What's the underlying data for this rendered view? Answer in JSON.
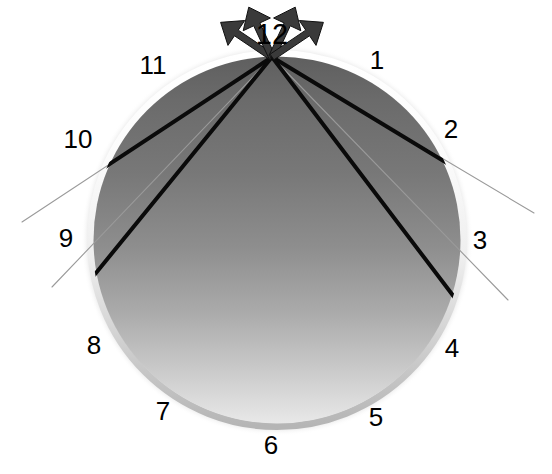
{
  "figure": {
    "type": "diagram",
    "background_color": "#ffffff",
    "width": 552,
    "height": 474
  },
  "sphere": {
    "name": "shaded-sphere",
    "center_x": 277,
    "center_y": 240,
    "radius": 187,
    "gradient_top_color": "#6e6e6e",
    "gradient_bottom_color": "#e2e2e2",
    "rim_highlight_color": "#fdfdfd",
    "rim_shadow_color": "#b8b8b8",
    "halo_color": "#f2f2f2"
  },
  "apex": {
    "name": "apex-point",
    "x": 272,
    "y": 57,
    "label": "12"
  },
  "rays": [
    {
      "id": "ray-to-10",
      "name": "thick-ray-upper-left",
      "end_x": 96,
      "end_y": 173,
      "color": "#0a0a0a",
      "width": 4.0
    },
    {
      "id": "ray-to-9",
      "name": "thick-ray-lower-left",
      "end_x": 100,
      "end_y": 268,
      "color": "#0a0a0a",
      "width": 4.0
    },
    {
      "id": "ray-to-2",
      "name": "thick-ray-upper-right",
      "end_x": 447,
      "end_y": 163,
      "color": "#0a0a0a",
      "width": 4.0
    },
    {
      "id": "ray-to-3",
      "name": "thick-ray-lower-right",
      "end_x": 442,
      "end_y": 281,
      "color": "#0a0a0a",
      "width": 4.0
    }
  ],
  "ray_extensions": [
    {
      "id": "ext-to-10",
      "name": "thin-ray-extension-upper-left",
      "end_x": 22,
      "end_y": 222,
      "color": "#9a9a9a",
      "width": 1.1
    },
    {
      "id": "ext-to-9",
      "name": "thin-ray-extension-lower-left",
      "end_x": 52,
      "end_y": 287,
      "color": "#9a9a9a",
      "width": 1.1
    },
    {
      "id": "ext-to-2",
      "name": "thin-ray-extension-upper-right",
      "end_x": 534,
      "end_y": 213,
      "color": "#9a9a9a",
      "width": 1.1
    },
    {
      "id": "ext-to-3",
      "name": "thin-ray-extension-lower-right",
      "end_x": 508,
      "end_y": 300,
      "color": "#9a9a9a",
      "width": 1.1
    }
  ],
  "arrows": [
    {
      "id": "arrow-far-left",
      "name": "arrow-outward-far-left",
      "angle_deg": 146,
      "length": 62,
      "color": "#3a3a3a"
    },
    {
      "id": "arrow-near-left",
      "name": "arrow-outward-near-left",
      "angle_deg": 115,
      "length": 55,
      "color": "#3a3a3a"
    },
    {
      "id": "arrow-near-right",
      "name": "arrow-outward-near-right",
      "angle_deg": 65,
      "length": 55,
      "color": "#3a3a3a"
    },
    {
      "id": "arrow-far-right",
      "name": "arrow-outward-far-right",
      "angle_deg": 34,
      "length": 62,
      "color": "#3a3a3a"
    }
  ],
  "hour_labels": [
    {
      "hour": "12",
      "x": 272,
      "y": 34,
      "size": "big"
    },
    {
      "hour": "1",
      "x": 377,
      "y": 60
    },
    {
      "hour": "2",
      "x": 451,
      "y": 129
    },
    {
      "hour": "3",
      "x": 480,
      "y": 240
    },
    {
      "hour": "4",
      "x": 452,
      "y": 348
    },
    {
      "hour": "5",
      "x": 376,
      "y": 417
    },
    {
      "hour": "6",
      "x": 271,
      "y": 445
    },
    {
      "hour": "7",
      "x": 163,
      "y": 411
    },
    {
      "hour": "8",
      "x": 94,
      "y": 345
    },
    {
      "hour": "9",
      "x": 66,
      "y": 238
    },
    {
      "hour": "10",
      "x": 78,
      "y": 139
    },
    {
      "hour": "11",
      "x": 153,
      "y": 65
    }
  ]
}
